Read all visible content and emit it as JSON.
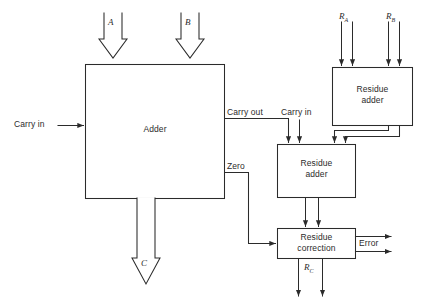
{
  "diagram": {
    "stroke_color": "#2b2b2b",
    "background_color": "#ffffff",
    "blocks": [
      {
        "id": "adder",
        "label": "Adder",
        "line1": "Adder",
        "line2": ""
      },
      {
        "id": "residue-adder-top",
        "label": "Residue adder",
        "line1": "Residue",
        "line2": "adder"
      },
      {
        "id": "residue-adder-mid",
        "label": "Residue adder",
        "line1": "Residue",
        "line2": "adder"
      },
      {
        "id": "residue-correction",
        "label": "Residue correction",
        "line1": "Residue",
        "line2": "correction"
      }
    ],
    "signals": {
      "carry_in_left": "Carry in",
      "carry_out": "Carry out",
      "carry_in_right": "Carry in",
      "zero": "Zero",
      "error": "Error"
    },
    "buses": {
      "a": "A",
      "b": "B",
      "c": "C",
      "ra": "R",
      "ra_sub": "A",
      "rb": "R",
      "rb_sub": "B",
      "rc": "R",
      "rc_sub": "C"
    }
  }
}
